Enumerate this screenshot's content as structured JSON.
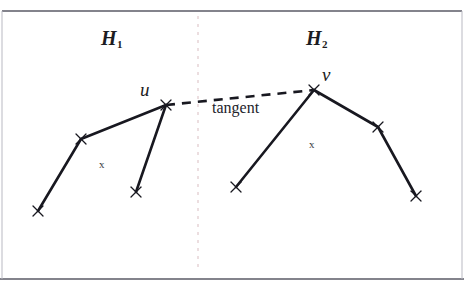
{
  "figure": {
    "background_color": "#ffffff",
    "ink_color": "#181820",
    "divider_color": "#e0c9cc",
    "rule_color": "#5a5a66",
    "labels": {
      "hull_left": "H",
      "hull_left_sub": "1",
      "hull_right": "H",
      "hull_right_sub": "2",
      "vertex_u": "u",
      "vertex_v": "v",
      "tangent": "tangent",
      "interior_left": "x",
      "interior_right": "x"
    },
    "rules": [
      {
        "name": "top-rule",
        "y": 11
      },
      {
        "name": "bottom-rule",
        "y": 279
      }
    ],
    "divider": {
      "x": 198,
      "y1": 16,
      "y2": 270,
      "dash": "3,5"
    },
    "hull_left": {
      "name": "H1",
      "vertices": [
        {
          "x": 38,
          "y": 211
        },
        {
          "x": 81,
          "y": 139
        },
        {
          "x": 166,
          "y": 105
        },
        {
          "x": 136,
          "y": 192
        }
      ],
      "edges": [
        [
          0,
          1
        ],
        [
          1,
          2
        ],
        [
          2,
          3
        ]
      ]
    },
    "hull_right": {
      "name": "H2",
      "vertices": [
        {
          "x": 236,
          "y": 187
        },
        {
          "x": 314,
          "y": 90
        },
        {
          "x": 378,
          "y": 127
        },
        {
          "x": 416,
          "y": 196
        }
      ],
      "edges": [
        [
          0,
          1
        ],
        [
          1,
          2
        ],
        [
          2,
          3
        ]
      ]
    },
    "tangent_segment": {
      "name": "tangent",
      "from": {
        "x": 166,
        "y": 105
      },
      "to": {
        "x": 314,
        "y": 90
      },
      "dash": "9,7"
    },
    "label_positions": {
      "hull_left": {
        "x": 101,
        "y": 28
      },
      "hull_right": {
        "x": 306,
        "y": 28
      },
      "vertex_u": {
        "x": 140,
        "y": 80
      },
      "vertex_v": {
        "x": 322,
        "y": 65
      },
      "tangent": {
        "x": 212,
        "y": 100
      },
      "interior_left": {
        "x": 99,
        "y": 159
      },
      "interior_right": {
        "x": 309,
        "y": 139
      }
    }
  }
}
